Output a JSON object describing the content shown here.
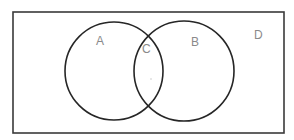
{
  "diagram": {
    "type": "venn",
    "universe": {
      "label": "D",
      "x": 13,
      "y": 12,
      "width": 271,
      "height": 121,
      "stroke": "#3a3a3a"
    },
    "sets": [
      {
        "id": "set-a",
        "label": "A",
        "cx": 114,
        "cy": 71,
        "r": 49,
        "stroke": "#262626"
      },
      {
        "id": "set-b",
        "label": "B",
        "cx": 184,
        "cy": 71,
        "r": 50,
        "stroke": "#262626"
      }
    ],
    "regions": [
      {
        "id": "region-a",
        "label": "A",
        "x": 96,
        "y": 45
      },
      {
        "id": "region-intersection",
        "label": "C",
        "x": 142,
        "y": 53
      },
      {
        "id": "region-b",
        "label": "B",
        "x": 191,
        "y": 46
      },
      {
        "id": "region-outside",
        "label": "D",
        "x": 254,
        "y": 39
      }
    ],
    "label_color": "#8a8a8a"
  }
}
